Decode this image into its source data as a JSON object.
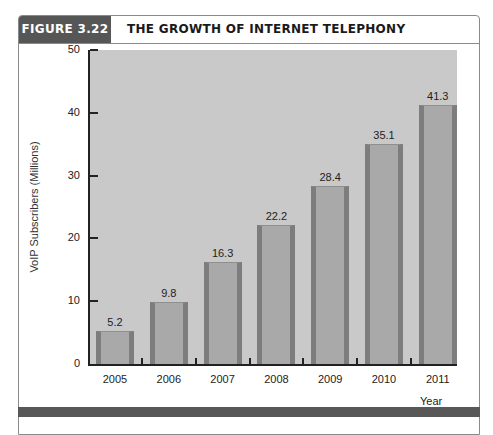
{
  "header": {
    "figure_label": "FIGURE 3.22",
    "title": "THE GROWTH OF INTERNET TELEPHONY"
  },
  "colors": {
    "label_bg": "#565656",
    "plot_bg": "#c9c9c9",
    "bar_fill": "#a9a9a9",
    "bar_edge": "#7d7d7d",
    "band": "#585858"
  },
  "chart_data": {
    "type": "bar",
    "title": "THE GROWTH OF INTERNET TELEPHONY",
    "xlabel": "Year",
    "ylabel": "VoIP Subscribers (Millions)",
    "categories": [
      "2005",
      "2006",
      "2007",
      "2008",
      "2009",
      "2010",
      "2011"
    ],
    "values": [
      5.2,
      9.8,
      16.3,
      22.2,
      28.4,
      35.1,
      41.3
    ],
    "value_labels": [
      "5.2",
      "9.8",
      "16.3",
      "22.2",
      "28.4",
      "35.1",
      "41.3"
    ],
    "ylim": [
      0,
      50
    ],
    "yticks": [
      "0",
      "10",
      "20",
      "30",
      "40",
      "50"
    ],
    "grid": false,
    "legend": null
  }
}
